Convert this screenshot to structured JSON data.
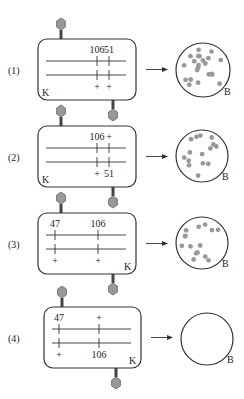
{
  "colors": {
    "stroke": "#333333",
    "phage_head": "#999999",
    "phage_head_stroke": "#666666",
    "plaque_dot": "#999999",
    "background": "#ffffff"
  },
  "rows": [
    {
      "label": "(1)",
      "box": {
        "x": 38,
        "y": 39,
        "w": 98,
        "h": 61
      },
      "corner_label": {
        "text": "K",
        "pos": "bottom-left"
      },
      "markers": [
        {
          "x": 97,
          "top_text": "106",
          "bottom_text": "+"
        },
        {
          "x": 109,
          "top_text": "51",
          "bottom_text": "+"
        }
      ],
      "phages": [
        {
          "x": 61,
          "side": "top"
        },
        {
          "x": 113,
          "side": "bottom"
        }
      ],
      "plate": {
        "cx": 203,
        "cy": 70,
        "r": 27,
        "label": "B",
        "dots": 22,
        "result": "plaques"
      }
    },
    {
      "label": "(2)",
      "box": {
        "x": 38,
        "y": 126,
        "w": 98,
        "h": 61
      },
      "corner_label": {
        "text": "K",
        "pos": "bottom-left"
      },
      "markers": [
        {
          "x": 97,
          "top_text": "106",
          "bottom_text": "+"
        },
        {
          "x": 109,
          "top_text": "+",
          "bottom_text": "51"
        }
      ],
      "phages": [
        {
          "x": 61,
          "side": "top"
        },
        {
          "x": 113,
          "side": "bottom"
        }
      ],
      "plate": {
        "cx": 202,
        "cy": 156,
        "r": 26,
        "label": "B",
        "dots": 15,
        "result": "plaques"
      }
    },
    {
      "label": "(3)",
      "box": {
        "x": 38,
        "y": 213,
        "w": 98,
        "h": 61
      },
      "corner_label": {
        "text": "K",
        "pos": "bottom-right"
      },
      "markers": [
        {
          "x": 55,
          "top_text": "47",
          "bottom_text": "+"
        },
        {
          "x": 98,
          "top_text": "106",
          "bottom_text": "+"
        }
      ],
      "phages": [
        {
          "x": 61,
          "side": "top"
        },
        {
          "x": 113,
          "side": "bottom"
        }
      ],
      "plate": {
        "cx": 202,
        "cy": 243,
        "r": 26,
        "label": "B",
        "dots": 15,
        "result": "plaques"
      }
    },
    {
      "label": "(4)",
      "box": {
        "x": 44,
        "y": 307,
        "w": 97,
        "h": 61
      },
      "corner_label": {
        "text": "K",
        "pos": "bottom-right"
      },
      "markers": [
        {
          "x": 59,
          "top_text": "47",
          "bottom_text": "+"
        },
        {
          "x": 99,
          "top_text": "+",
          "bottom_text": "106"
        }
      ],
      "phages": [
        {
          "x": 62,
          "side": "top"
        },
        {
          "x": 116,
          "side": "bottom"
        }
      ],
      "plate": {
        "cx": 207,
        "cy": 339,
        "r": 26,
        "label": "B",
        "dots": 0,
        "result": "no plaques"
      }
    }
  ]
}
